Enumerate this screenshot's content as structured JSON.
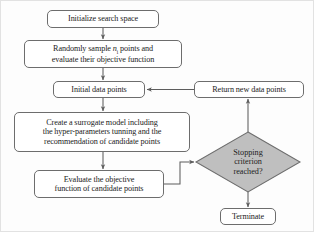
{
  "diagram": {
    "type": "flowchart",
    "stroke_color": "#6d6d6d",
    "text_color": "#1c1c1c",
    "decision_fill": "#bfbfbf",
    "process_fill": "#ffffff",
    "nodes": {
      "initialize": {
        "label": "Initialize search space",
        "shape": "rounded-rectangle",
        "x": 47,
        "y": 10,
        "w": 112,
        "h": 18,
        "font_size": 8.2
      },
      "sample": {
        "label_line1_prefix": "Randomly sample ",
        "label_line1_var": "n",
        "label_line1_sub": "i",
        "label_line1_suffix": " points and",
        "label_line2": "evaluate their objective function",
        "shape": "rounded-rectangle",
        "x": 24,
        "y": 40,
        "w": 158,
        "h": 28,
        "font_size": 8.2
      },
      "initial_data": {
        "label": "Initial  data points",
        "shape": "rounded-rectangle",
        "x": 53,
        "y": 81,
        "w": 92,
        "h": 17,
        "font_size": 8.2
      },
      "surrogate": {
        "label": "Create a surrogate model including\nthe hyper-parameters tunning and the\nrecommendation of candidate points",
        "shape": "rounded-rectangle",
        "x": 14,
        "y": 112,
        "w": 176,
        "h": 40,
        "font_size": 8.2
      },
      "evaluate": {
        "label": "Evaluate the objective\nfunction of candidate points",
        "shape": "rounded-rectangle",
        "x": 34,
        "y": 170,
        "w": 130,
        "h": 28,
        "font_size": 8.2
      },
      "stopping": {
        "label": "Stopping\ncriterion\nreached?",
        "shape": "diamond",
        "cx": 248,
        "cy": 162,
        "rx": 52,
        "ry": 30,
        "font_size": 8.2
      },
      "return_points": {
        "label": "Return new data points",
        "shape": "rounded-rectangle",
        "x": 194,
        "y": 81,
        "w": 110,
        "h": 17,
        "font_size": 8.2
      },
      "terminate": {
        "label": "Terminate",
        "shape": "rounded-rectangle",
        "x": 220,
        "y": 208,
        "w": 56,
        "h": 17,
        "font_size": 8.2
      }
    },
    "edges": [
      {
        "name": "initialize-to-sample",
        "from": "initialize",
        "to": "sample",
        "arrow": true
      },
      {
        "name": "sample-to-initial-data",
        "from": "sample",
        "to": "initial_data",
        "arrow": true
      },
      {
        "name": "initial-data-to-surrogate",
        "from": "initial_data",
        "to": "surrogate",
        "arrow": true
      },
      {
        "name": "surrogate-to-evaluate",
        "from": "surrogate",
        "to": "evaluate",
        "arrow": true
      },
      {
        "name": "evaluate-to-stopping",
        "from": "evaluate",
        "to": "stopping",
        "arrow": true
      },
      {
        "name": "stopping-to-return-points",
        "from": "stopping",
        "to": "return_points",
        "arrow": true
      },
      {
        "name": "return-points-to-initial-data",
        "from": "return_points",
        "to": "initial_data",
        "arrow": true
      },
      {
        "name": "stopping-to-terminate",
        "from": "stopping",
        "to": "terminate",
        "arrow": true
      }
    ]
  }
}
